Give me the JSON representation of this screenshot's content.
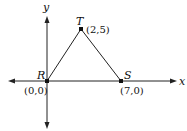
{
  "diagram": {
    "type": "coordinate-plane-triangle",
    "axes": {
      "x_label": "x",
      "y_label": "y"
    },
    "points": [
      {
        "name": "R",
        "coords_label": "(0,0)",
        "x": 0,
        "y": 0
      },
      {
        "name": "T",
        "coords_label": "(2,5)",
        "x": 2,
        "y": 5
      },
      {
        "name": "S",
        "coords_label": "(7,0)",
        "x": 7,
        "y": 0
      }
    ],
    "segments": [
      {
        "from": "R",
        "to": "T"
      },
      {
        "from": "T",
        "to": "S"
      },
      {
        "from": "R",
        "to": "S"
      }
    ],
    "colors": {
      "line": "#222222",
      "background": "#ffffff"
    }
  }
}
